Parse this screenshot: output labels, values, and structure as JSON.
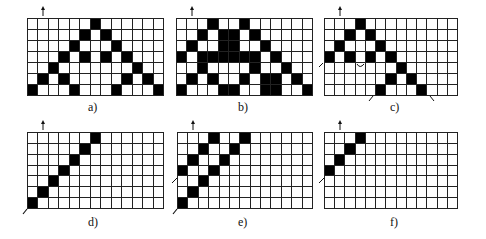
{
  "figure": {
    "grid_cols": 13,
    "grid_rows": 7,
    "panels": [
      {
        "id": "a",
        "label": "a)",
        "filled": [
          [
            0,
            6
          ],
          [
            1,
            5
          ],
          [
            1,
            7
          ],
          [
            2,
            4
          ],
          [
            2,
            8
          ],
          [
            3,
            3
          ],
          [
            3,
            5
          ],
          [
            3,
            7
          ],
          [
            3,
            9
          ],
          [
            4,
            2
          ],
          [
            4,
            10
          ],
          [
            5,
            1
          ],
          [
            5,
            3
          ],
          [
            5,
            9
          ],
          [
            5,
            11
          ],
          [
            6,
            0
          ],
          [
            6,
            4
          ],
          [
            6,
            8
          ],
          [
            6,
            12
          ]
        ],
        "arrows": [
          "top-col-1"
        ]
      },
      {
        "id": "b",
        "label": "b)",
        "filled": [
          [
            0,
            3
          ],
          [
            0,
            6
          ],
          [
            1,
            2
          ],
          [
            1,
            4
          ],
          [
            1,
            5
          ],
          [
            1,
            7
          ],
          [
            2,
            1
          ],
          [
            2,
            4
          ],
          [
            2,
            5
          ],
          [
            2,
            8
          ],
          [
            3,
            0
          ],
          [
            3,
            2
          ],
          [
            3,
            3
          ],
          [
            3,
            4
          ],
          [
            3,
            5
          ],
          [
            3,
            6
          ],
          [
            3,
            7
          ],
          [
            3,
            9
          ],
          [
            4,
            2
          ],
          [
            4,
            7
          ],
          [
            4,
            10
          ],
          [
            5,
            1
          ],
          [
            5,
            3
          ],
          [
            5,
            6
          ],
          [
            5,
            8
          ],
          [
            5,
            9
          ],
          [
            5,
            11
          ],
          [
            6,
            0
          ],
          [
            6,
            4
          ],
          [
            6,
            5
          ],
          [
            6,
            8
          ],
          [
            6,
            9
          ],
          [
            6,
            12
          ]
        ],
        "arrows": [
          "top-col-1"
        ]
      },
      {
        "id": "c",
        "label": "c)",
        "filled": [
          [
            0,
            3
          ],
          [
            1,
            2
          ],
          [
            1,
            4
          ],
          [
            2,
            1
          ],
          [
            2,
            5
          ],
          [
            3,
            0
          ],
          [
            3,
            2
          ],
          [
            3,
            4
          ],
          [
            3,
            6
          ],
          [
            4,
            7
          ],
          [
            5,
            6
          ],
          [
            5,
            8
          ],
          [
            6,
            5
          ],
          [
            6,
            9
          ]
        ],
        "arrows": [
          "top-col-1",
          "left-row-4",
          "curve-col-3",
          "bottom-col-5",
          "bottom-col-10"
        ]
      },
      {
        "id": "d",
        "label": "d)",
        "filled": [
          [
            0,
            6
          ],
          [
            1,
            5
          ],
          [
            2,
            4
          ],
          [
            3,
            3
          ],
          [
            4,
            2
          ],
          [
            5,
            1
          ],
          [
            6,
            0
          ]
        ],
        "arrows": [
          "top-col-1",
          "bottom-left-corner"
        ]
      },
      {
        "id": "e",
        "label": "e)",
        "filled": [
          [
            0,
            3
          ],
          [
            0,
            6
          ],
          [
            1,
            2
          ],
          [
            1,
            5
          ],
          [
            2,
            1
          ],
          [
            2,
            4
          ],
          [
            3,
            0
          ],
          [
            3,
            3
          ],
          [
            4,
            2
          ],
          [
            5,
            1
          ],
          [
            6,
            0
          ]
        ],
        "arrows": [
          "top-col-1",
          "left-row-4",
          "bottom-left-corner"
        ]
      },
      {
        "id": "f",
        "label": "f)",
        "filled": [
          [
            0,
            3
          ],
          [
            1,
            2
          ],
          [
            2,
            1
          ],
          [
            3,
            0
          ]
        ],
        "arrows": [
          "top-col-1",
          "left-row-4"
        ]
      }
    ],
    "colors": {
      "filled": "#000000",
      "empty": "#ffffff",
      "lines": "#222222"
    }
  }
}
